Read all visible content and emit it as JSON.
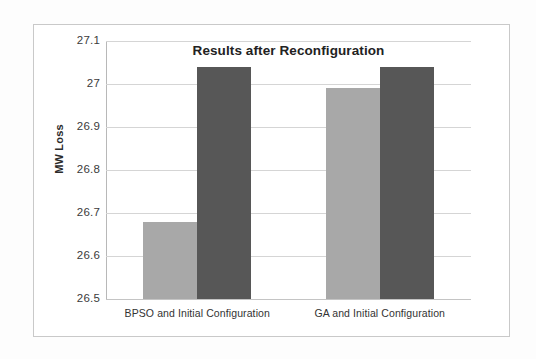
{
  "chart_data": {
    "type": "bar",
    "title": "Results after Reconfiguration",
    "xlabel": "",
    "ylabel": "MW Loss",
    "ylim": [
      26.5,
      27.1
    ],
    "ytick_labels": [
      "27.1",
      "27",
      "26.9",
      "26.8",
      "26.7",
      "26.6",
      "26.5"
    ],
    "ytick_values": [
      27.1,
      27.0,
      26.9,
      26.8,
      26.7,
      26.6,
      26.5
    ],
    "grid": true,
    "legend": "none",
    "categories": [
      "BPSO and Initial Configuration",
      "GA and Initial Configuration"
    ],
    "series": [
      {
        "name": "Optimized Configuration",
        "color": "#a8a8a8",
        "values": [
          26.68,
          26.99
        ]
      },
      {
        "name": "Initial Configuration",
        "color": "#575757",
        "values": [
          27.04,
          27.04
        ]
      }
    ]
  },
  "colors": {
    "bar_light": "#a8a8a8",
    "bar_dark": "#575757",
    "gridline": "#d5d5d5",
    "axis": "#b8b8b8",
    "text": "#333333",
    "frame_border": "#c9c9c9"
  }
}
